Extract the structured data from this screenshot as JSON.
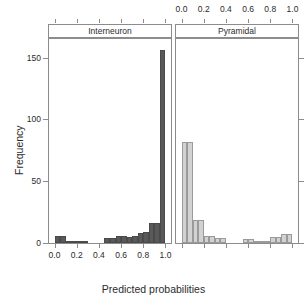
{
  "chart_data": {
    "type": "bar",
    "title": "",
    "xlabel": "Predicted probabilities",
    "ylabel": "Frequency",
    "xlim": [
      -0.05,
      1.05
    ],
    "ylim": [
      0,
      165
    ],
    "grid": false,
    "legend": "none",
    "binwidth": 0.05,
    "panels": [
      {
        "label": "Interneuron",
        "color": "#595959",
        "axis_side": "bottom",
        "xticks": [
          "0.0",
          "0.2",
          "0.4",
          "0.6",
          "0.8",
          "1.0"
        ],
        "xtickvals": [
          0.0,
          0.2,
          0.4,
          0.6,
          0.8,
          1.0
        ],
        "bin_centers": [
          0.025,
          0.075,
          0.125,
          0.175,
          0.225,
          0.275,
          0.325,
          0.375,
          0.425,
          0.475,
          0.525,
          0.575,
          0.625,
          0.675,
          0.725,
          0.775,
          0.825,
          0.875,
          0.925,
          0.975
        ],
        "values": [
          6,
          6,
          1,
          2,
          1,
          1,
          0,
          0,
          0,
          4,
          4,
          6,
          6,
          5,
          6,
          8,
          9,
          16,
          16,
          156
        ]
      },
      {
        "label": "Pyramidal",
        "color": "#d2d2d2",
        "axis_side": "top",
        "xticks": [
          "0.0",
          "0.2",
          "0.4",
          "0.6",
          "0.8",
          "1.0"
        ],
        "xtickvals": [
          0.0,
          0.2,
          0.4,
          0.6,
          0.8,
          1.0
        ],
        "bin_centers": [
          0.025,
          0.075,
          0.125,
          0.175,
          0.225,
          0.275,
          0.325,
          0.375,
          0.425,
          0.475,
          0.525,
          0.575,
          0.625,
          0.675,
          0.725,
          0.775,
          0.825,
          0.875,
          0.925,
          0.975
        ],
        "values": [
          82,
          82,
          19,
          19,
          6,
          6,
          4,
          4,
          0,
          0,
          0,
          3,
          3,
          2,
          2,
          2,
          5,
          5,
          7,
          7
        ]
      }
    ],
    "yticks": [
      "0",
      "50",
      "100",
      "150"
    ],
    "ytickvals": [
      0,
      50,
      100,
      150
    ]
  },
  "axis": {
    "ylabel": "Frequency",
    "xlabel": "Predicted probabilities"
  },
  "colors": {
    "interneuron_bar": "#595959",
    "pyramidal_bar": "#d2d2d2",
    "frame": "#8c8c8c",
    "text": "#2b2b2b",
    "background": "#ffffff"
  }
}
